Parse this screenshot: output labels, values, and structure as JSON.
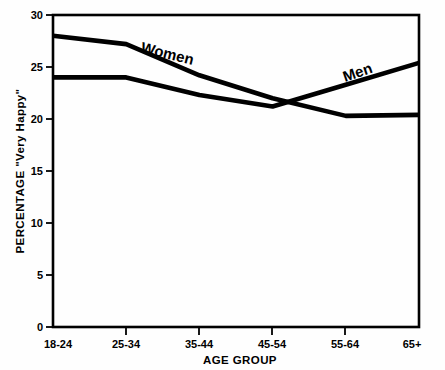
{
  "chart_data": {
    "type": "line",
    "title": "",
    "xlabel": "AGE GROUP",
    "ylabel": "PERCENTAGE \"Very Happy\"",
    "categories": [
      "18-24",
      "25-34",
      "35-44",
      "45-54",
      "55-64",
      "65+"
    ],
    "series": [
      {
        "name": "Women",
        "values": [
          28.0,
          27.2,
          24.2,
          22.0,
          20.3,
          20.4
        ],
        "label": "Women",
        "label_rotation_deg": 14
      },
      {
        "name": "Men",
        "values": [
          24.0,
          24.0,
          22.3,
          21.2,
          23.3,
          25.4
        ],
        "label": "Men",
        "label_rotation_deg": -19
      }
    ],
    "ylim": [
      0,
      30
    ],
    "xlim_categories": 6,
    "yticks": [
      0,
      5,
      10,
      15,
      20,
      25,
      30
    ],
    "ytick_labels": [
      "0",
      "5",
      "10",
      "15",
      "20",
      "25",
      "30"
    ],
    "xtick_labels": [
      "18-24",
      "25-34",
      "35-44",
      "45-54",
      "55-64",
      "65+"
    ],
    "grid": false,
    "legend": "inline-on-curves",
    "line_color": "#000000",
    "axis_color": "#000000",
    "background_color": "#ffffff"
  }
}
